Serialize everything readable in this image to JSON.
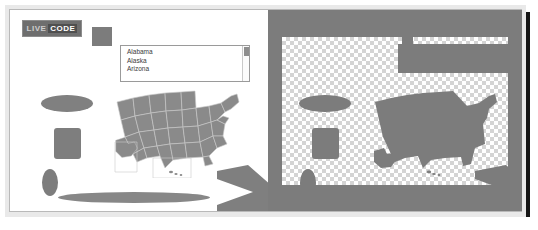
{
  "app": {
    "title": "LIVE CODE",
    "logo": {
      "part_one": "LIVE",
      "part_two": "CODE"
    }
  },
  "left_panel": {
    "name": "composition-canvas",
    "background_color": "#ffffff",
    "state_list": {
      "label": "state-list",
      "items": [
        "Alabama",
        "Alaska",
        "Arizona"
      ],
      "scrollbar": "vertical"
    },
    "swatch": {
      "color": "#7c7c7c"
    },
    "shapes": [
      {
        "name": "wide-ellipse",
        "color": "#808080"
      },
      {
        "name": "rounded-rectangle",
        "color": "#7e7e7e"
      },
      {
        "name": "small-ellipse",
        "color": "#7d7d7d"
      },
      {
        "name": "lens-sliver",
        "color": "#878787"
      },
      {
        "name": "chevron-arrow",
        "color": "#7f7f7f"
      },
      {
        "name": "us-map",
        "color": "#7a7a7a"
      }
    ]
  },
  "right_panel": {
    "name": "alpha-mask-preview",
    "background_color": "#7c7c7c",
    "transparency_pattern": "checkerboard",
    "checker_colors": [
      "#ffffff",
      "#d4d4d4"
    ],
    "mask_color": "#7c7c7c"
  }
}
